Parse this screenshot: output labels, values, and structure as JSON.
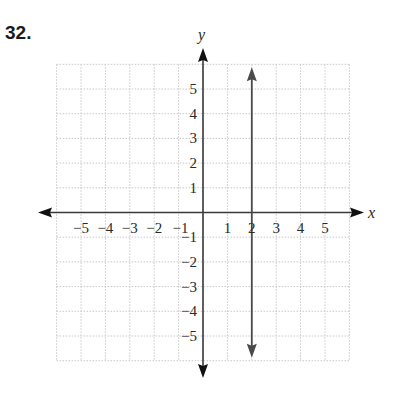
{
  "problem": {
    "number": "32."
  },
  "chart_data": {
    "type": "line",
    "title": "",
    "xlabel": "x",
    "ylabel": "y",
    "xlim": [
      -6,
      6
    ],
    "ylim": [
      -6,
      6
    ],
    "grid": true,
    "grid_style": "dotted",
    "x_ticks": [
      "−5",
      "−4",
      "−3",
      "−2",
      "−1",
      "1",
      "2",
      "3",
      "4",
      "5"
    ],
    "y_ticks": [
      "5",
      "4",
      "3",
      "2",
      "1",
      "−1",
      "−2",
      "−3",
      "−4",
      "−5"
    ],
    "series": [
      {
        "name": "x = 2",
        "type": "vertical-line",
        "x": 2,
        "y_range": [
          -5.8,
          5.8
        ],
        "arrows": "both"
      }
    ]
  },
  "colors": {
    "axis": "#3a3a3a",
    "line": "#4a4a4a",
    "grid": "#c8c8c8",
    "text": "#2a2a2a"
  }
}
